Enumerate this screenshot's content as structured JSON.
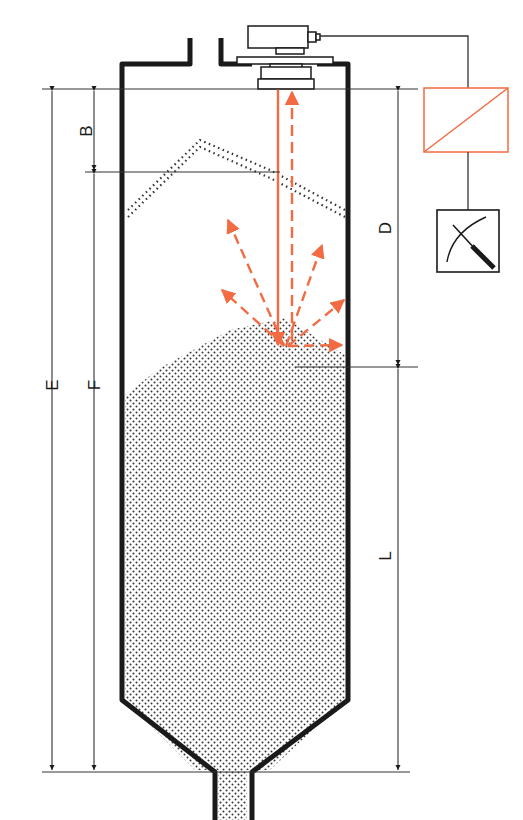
{
  "diagram": {
    "colors": {
      "wall": "#1a1a1a",
      "line": "#333333",
      "signal": "#f26b43",
      "fill_dots": "#333333",
      "background": "#ffffff"
    },
    "dimensions": {
      "E": "E",
      "F": "F",
      "B": "B",
      "D": "D",
      "L": "L"
    },
    "components": {
      "sensor": "sensor-transmitter",
      "converter": "signal-converter",
      "indicator": "analog-meter"
    }
  }
}
